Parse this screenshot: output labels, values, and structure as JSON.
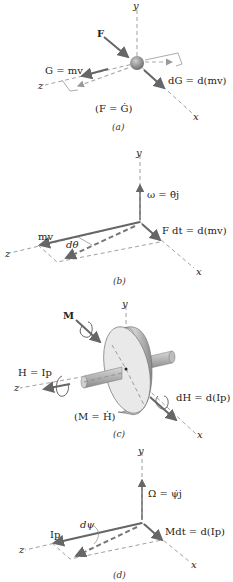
{
  "figure": {
    "panels": [
      {
        "id": "a",
        "caption": "(a)",
        "axes": {
          "x": "x",
          "y": "y",
          "z": "z"
        },
        "labels": {
          "force": "F",
          "momentum": "G = mv",
          "change": "dG = d(mv)",
          "equation": "(F = Ġ)"
        }
      },
      {
        "id": "b",
        "caption": "(b)",
        "axes": {
          "x": "x",
          "y": "y",
          "z": "z"
        },
        "labels": {
          "omega": "ω = θ̇j",
          "momentum": "mv",
          "angle": "dθ",
          "impulse": "F dt = d(mv)"
        }
      },
      {
        "id": "c",
        "caption": "(c)",
        "axes": {
          "x": "x",
          "y": "y",
          "z": "z"
        },
        "labels": {
          "moment": "M",
          "angular_momentum": "H = Ip",
          "change": "dH = d(Ip)",
          "equation": "(M = Ḣ)"
        }
      },
      {
        "id": "d",
        "caption": "(d)",
        "axes": {
          "x": "x",
          "y": "y",
          "z": "z"
        },
        "labels": {
          "omega": "Ω = ψ̇j",
          "momentum": "Ip",
          "angle": "dψ",
          "impulse": "Mdt = d(Ip)"
        }
      }
    ]
  },
  "colors": {
    "vector": "#666666",
    "axis": "#888888",
    "particle": "#8a8a8a",
    "disk_face": "#e8e8e8",
    "disk_rim": "#b0b0b0"
  }
}
